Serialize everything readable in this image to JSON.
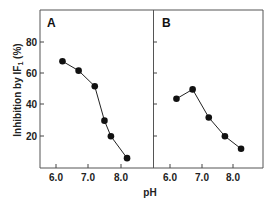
{
  "chart_data": [
    {
      "type": "line",
      "panel": "A",
      "xlabel": "pH",
      "ylabel": "Inhibition by IF1 (%)",
      "x_ticks": [
        "6.0",
        "7.0",
        "8.0"
      ],
      "y_ticks": [
        "20",
        "40",
        "60",
        "80"
      ],
      "xlim": [
        5.5,
        9.0
      ],
      "ylim": [
        0,
        100
      ],
      "grid": false,
      "series": [
        {
          "name": "A",
          "x": [
            6.2,
            6.7,
            7.2,
            7.5,
            7.7,
            8.2
          ],
          "values": [
            68,
            62,
            52,
            30,
            20,
            6
          ]
        }
      ]
    },
    {
      "type": "line",
      "panel": "B",
      "xlabel": "pH",
      "ylabel": "Inhibition by IF1 (%)",
      "x_ticks": [
        "6.0",
        "7.0",
        "8.0"
      ],
      "y_ticks": [
        "20",
        "40",
        "60",
        "80"
      ],
      "xlim": [
        5.5,
        9.0
      ],
      "ylim": [
        0,
        100
      ],
      "grid": false,
      "series": [
        {
          "name": "B",
          "x": [
            6.2,
            6.7,
            7.2,
            7.7,
            8.2
          ],
          "values": [
            44,
            50,
            32,
            20,
            12
          ]
        }
      ]
    }
  ],
  "labels": {
    "panel_a": "A",
    "panel_b": "B",
    "y_axis": "Inhibition by IF",
    "y_axis_sub": "1",
    "y_axis_unit": " (%)",
    "x_axis": "pH",
    "y_tick_80": "80",
    "y_tick_60": "60",
    "y_tick_40": "40",
    "y_tick_20": "20",
    "x_tick_6": "6.0",
    "x_tick_7": "7.0",
    "x_tick_8": "8.0"
  },
  "colors": {
    "line": "#222222",
    "marker": "#111111",
    "frame": "#555555"
  }
}
